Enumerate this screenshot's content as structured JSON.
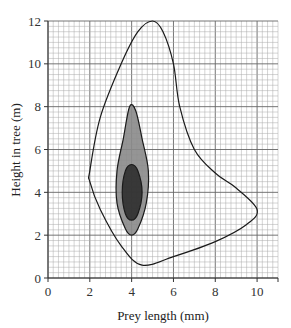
{
  "chart_data": {
    "type": "contour",
    "title": "",
    "xlabel": "Prey length (mm)",
    "ylabel": "Height in tree (m)",
    "xlim": [
      0,
      11
    ],
    "ylim": [
      0,
      12
    ],
    "xticks": [
      "0",
      "2",
      "4",
      "6",
      "8",
      "10"
    ],
    "yticks": [
      "0",
      "2",
      "4",
      "6",
      "8",
      "10",
      "12"
    ],
    "grid": "fine graph-paper grid (0.25 mm / 0.25 m minor, 2-unit major)",
    "contours": [
      {
        "name": "outer",
        "fill": "none",
        "points": [
          [
            2,
            5
          ],
          [
            2.5,
            7.5
          ],
          [
            3.5,
            10
          ],
          [
            4.3,
            11.5
          ],
          [
            5,
            12
          ],
          [
            5.5,
            11.5
          ],
          [
            6,
            10
          ],
          [
            6.3,
            8
          ],
          [
            7,
            6
          ],
          [
            8,
            4.9
          ],
          [
            9,
            4.2
          ],
          [
            10,
            3.2
          ],
          [
            9.5,
            2.5
          ],
          [
            8,
            1.7
          ],
          [
            6,
            1
          ],
          [
            4.5,
            0.6
          ],
          [
            3.5,
            1.5
          ],
          [
            2.5,
            3.2
          ],
          [
            2,
            4.5
          ]
        ]
      },
      {
        "name": "middle",
        "fill": "#8a8a8a",
        "points": [
          [
            3.9,
            8
          ],
          [
            4.2,
            7.8
          ],
          [
            4.5,
            6.5
          ],
          [
            4.8,
            5
          ],
          [
            4.7,
            3.5
          ],
          [
            4.3,
            2.3
          ],
          [
            4,
            2
          ],
          [
            3.7,
            2.3
          ],
          [
            3.3,
            3.5
          ],
          [
            3.3,
            5
          ],
          [
            3.6,
            6.5
          ]
        ]
      },
      {
        "name": "inner",
        "fill": "#2e2e2e",
        "points": [
          [
            4,
            5.3
          ],
          [
            4.3,
            5
          ],
          [
            4.5,
            4
          ],
          [
            4.3,
            3
          ],
          [
            4,
            2.7
          ],
          [
            3.7,
            3
          ],
          [
            3.55,
            4
          ],
          [
            3.7,
            5
          ]
        ]
      }
    ]
  }
}
